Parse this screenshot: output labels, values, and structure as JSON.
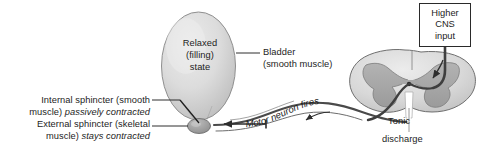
{
  "figure": {
    "width": 480,
    "height": 163,
    "background": "#ffffff"
  },
  "colors": {
    "outline": "#3a3a3a",
    "text": "#1d1d1d",
    "bladder_fill_light": "#e3e3e3",
    "bladder_fill_mid": "#c8c8c8",
    "sphincter_fill": "#9a9a9a",
    "cord_white_matter": "#d9d9d9",
    "cord_gray_matter": "#a6a6a6",
    "nerve": "#444444",
    "box_border": "#2a2a2a"
  },
  "bladder": {
    "state_line1": "Relaxed",
    "state_line2": "(filling)",
    "state_line3": "state",
    "callout_line1": "Bladder",
    "callout_line2": "(smooth muscle)"
  },
  "sphincters": {
    "internal": {
      "line1_plain": "Internal sphincter (smooth",
      "line2_plain": "muscle) ",
      "line2_italic": "passively contracted"
    },
    "external": {
      "line1_plain": "External sphincter (skeletal",
      "line2_plain": "muscle) ",
      "line2_italic": "stays contracted"
    }
  },
  "spinal_cord": {
    "tonic_label": "Tonic",
    "discharge_label": "discharge"
  },
  "higher_cns": {
    "line1": "Higher",
    "line2": "CNS",
    "line3": "input"
  },
  "motor_neuron": {
    "label": "Motor neuron fires"
  },
  "icons": {
    "arrow_to_sphincter": "left-arrow-icon",
    "arrow_to_cord": "curved-arrow-icon",
    "arrow_cns_down": "down-arrow-icon",
    "leader_bladder": "leader-line-icon",
    "leader_internal": "leader-line-icon",
    "leader_external": "leader-line-icon",
    "leader_tonic": "leader-line-icon"
  }
}
